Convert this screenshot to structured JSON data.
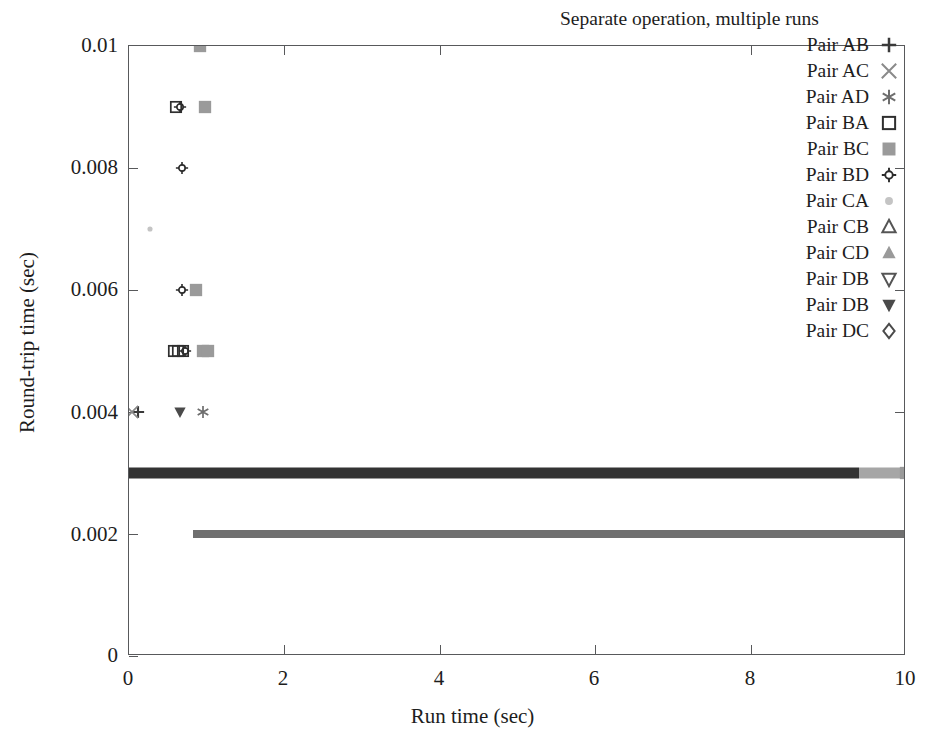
{
  "chart_data": {
    "type": "scatter",
    "title": "Separate operation, multiple runs",
    "xlabel": "Run time (sec)",
    "ylabel": "Round-trip time (sec)",
    "xlim": [
      0,
      10
    ],
    "ylim": [
      0,
      0.01
    ],
    "xticks": [
      "0",
      "2",
      "4",
      "6",
      "8",
      "10"
    ],
    "xtick_values": [
      0,
      2,
      4,
      6,
      8,
      10
    ],
    "yticks": [
      "0",
      "0.002",
      "0.004",
      "0.006",
      "0.008",
      "0.01"
    ],
    "ytick_values": [
      0,
      0.002,
      0.004,
      0.006,
      0.008,
      0.01
    ],
    "grid": false,
    "legend_position": "top-right",
    "series": [
      {
        "name": "Pair AB",
        "marker": "plus",
        "color": "#3a3a3a",
        "points": [
          [
            0.12,
            0.004
          ]
        ]
      },
      {
        "name": "Pair AC",
        "marker": "cross",
        "color": "#8a8a8a",
        "points": [
          [
            0.04,
            0.004
          ]
        ]
      },
      {
        "name": "Pair AD",
        "marker": "asterisk",
        "color": "#6e6e6e",
        "points": [
          [
            0.95,
            0.004
          ]
        ]
      },
      {
        "name": "Pair BA",
        "marker": "open-square",
        "color": "#2f2f2f",
        "points": [
          [
            0.58,
            0.005
          ],
          [
            0.63,
            0.005
          ],
          [
            0.7,
            0.005
          ],
          [
            0.6,
            0.009
          ]
        ]
      },
      {
        "name": "Pair BC",
        "marker": "filled-square-gray",
        "color": "#9a9a9a",
        "points": [
          [
            0.92,
            0.01
          ],
          [
            0.98,
            0.009
          ],
          [
            0.86,
            0.006
          ],
          [
            0.95,
            0.005
          ],
          [
            1.02,
            0.005
          ],
          [
            10.0,
            0.003
          ]
        ]
      },
      {
        "name": "Pair BD",
        "marker": "starburst",
        "color": "#2b2b2b",
        "points": [
          [
            0.68,
            0.008
          ],
          [
            0.68,
            0.006
          ],
          [
            0.72,
            0.005
          ],
          [
            0.66,
            0.009
          ]
        ]
      },
      {
        "name": "Pair CA",
        "marker": "small-dot-light",
        "color": "#c4c4c4",
        "points": [
          [
            0.27,
            0.007
          ]
        ]
      },
      {
        "name": "Pair CB",
        "marker": "open-triangle-up",
        "color": "#555555",
        "points": []
      },
      {
        "name": "Pair CD",
        "marker": "filled-triangle-up-gray",
        "color": "#9a9a9a",
        "points": []
      },
      {
        "name": "Pair DB",
        "marker": "open-triangle-down",
        "color": "#555555",
        "points": []
      },
      {
        "name": "Pair DB",
        "marker": "filled-triangle-down",
        "color": "#4a4a4a",
        "points": [
          [
            0.65,
            0.004
          ]
        ]
      },
      {
        "name": "Pair DC",
        "marker": "open-diamond",
        "color": "#4a4a4a",
        "points": []
      }
    ],
    "dense_bands": [
      {
        "label": "0.003 band (dark, continuous)",
        "y": 0.003,
        "x_start": 0.0,
        "x_end": 9.4,
        "color": "#333333",
        "thickness_px": 11
      },
      {
        "label": "0.003 band tail (light gray)",
        "y": 0.003,
        "x_start": 9.4,
        "x_end": 10.0,
        "color": "#a6a6a6",
        "thickness_px": 11
      },
      {
        "label": "0.002 band (medium gray, continuous)",
        "y": 0.002,
        "x_start": 0.82,
        "x_end": 10.0,
        "color": "#6f6f6f",
        "thickness_px": 8
      }
    ]
  },
  "legend": {
    "title": "Separate operation, multiple runs",
    "entries": [
      {
        "label": "Pair AB",
        "marker": "plus"
      },
      {
        "label": "Pair AC",
        "marker": "cross"
      },
      {
        "label": "Pair AD",
        "marker": "asterisk"
      },
      {
        "label": "Pair BA",
        "marker": "open-square"
      },
      {
        "label": "Pair BC",
        "marker": "filled-square-gray"
      },
      {
        "label": "Pair BD",
        "marker": "starburst"
      },
      {
        "label": "Pair CA",
        "marker": "small-dot-light"
      },
      {
        "label": "Pair CB",
        "marker": "open-triangle-up"
      },
      {
        "label": "Pair CD",
        "marker": "filled-triangle-up-gray"
      },
      {
        "label": "Pair DB",
        "marker": "open-triangle-down"
      },
      {
        "label": "Pair DB",
        "marker": "filled-triangle-down"
      },
      {
        "label": "Pair DC",
        "marker": "open-diamond"
      }
    ]
  },
  "axes": {
    "x_title": "Run time (sec)",
    "y_title": "Round-trip time (sec)",
    "x_ticks": [
      "0",
      "2",
      "4",
      "6",
      "8",
      "10"
    ],
    "y_ticks": [
      "0",
      "0.002",
      "0.004",
      "0.006",
      "0.008",
      "0.01"
    ]
  },
  "colors": {
    "frame": "#58595b",
    "text": "#1d1d1d",
    "background": "#ffffff",
    "band_dark": "#333333",
    "band_mid": "#6f6f6f",
    "band_light": "#a6a6a6"
  }
}
